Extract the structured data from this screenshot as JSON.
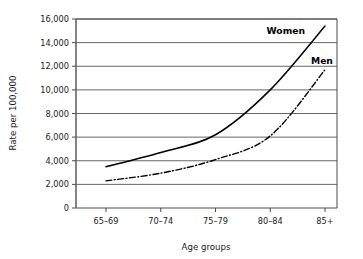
{
  "chart_data": {
    "type": "line",
    "title": "",
    "xlabel": "Age groups",
    "ylabel": "Rate per 100,000",
    "categories": [
      "65–69",
      "70–74",
      "75–79",
      "80–84",
      "85+"
    ],
    "ylim": [
      0,
      16000
    ],
    "ytick_values": [
      0,
      2000,
      4000,
      6000,
      8000,
      10000,
      12000,
      14000,
      16000
    ],
    "ytick_labels": [
      "0",
      "2,000",
      "4,000",
      "6,000",
      "8,000",
      "10,000",
      "12,000",
      "14,000",
      "16,000"
    ],
    "grid": "horizontal",
    "legend_position": "inline-right",
    "series": [
      {
        "name": "Women",
        "label": "Women",
        "style": "solid",
        "color": "#000000",
        "values": [
          3500,
          4700,
          6200,
          10000,
          15400
        ]
      },
      {
        "name": "Men",
        "label": "Men",
        "style": "dash-dot",
        "color": "#000000",
        "values": [
          2300,
          2950,
          4100,
          6100,
          11700
        ]
      }
    ]
  },
  "axes": {
    "y_title": "Rate per 100,000",
    "x_title": "Age groups"
  }
}
